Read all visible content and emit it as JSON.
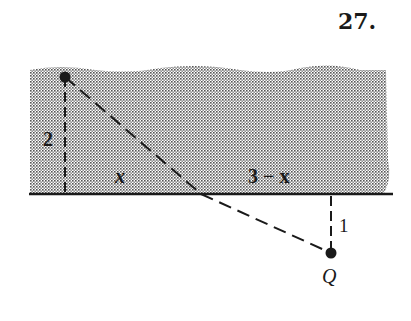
{
  "problem": {
    "number": "27."
  },
  "diagram": {
    "labels": {
      "vertical_left": "2",
      "segment_left": "x",
      "segment_right": "3 − x",
      "vertical_right": "1",
      "point_q": "Q"
    },
    "colors": {
      "ink": "#1a1a1a",
      "shading": "#bdbdbd",
      "background": "#ffffff"
    }
  }
}
